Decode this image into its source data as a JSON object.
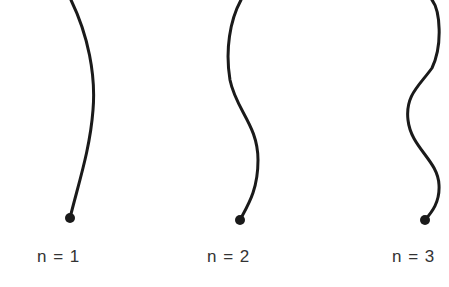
{
  "figure": {
    "colors": {
      "curve": "#1a1a1a",
      "label": "#333333",
      "background": "#ffffff"
    },
    "modes": [
      {
        "n": 1,
        "label": "n = 1",
        "label_x": 37,
        "path": "M 71 0 C 88 35, 96 75, 93 110 C 90 150, 78 185, 70 218",
        "dot": {
          "cx": 70,
          "cy": 218,
          "r": 5
        }
      },
      {
        "n": 2,
        "label": "n = 2",
        "label_x": 207,
        "path": "M 241 0 C 230 20, 225 50, 230 80 C 236 110, 258 125, 258 160 C 258 190, 248 205, 240 220",
        "dot": {
          "cx": 240,
          "cy": 220,
          "r": 5
        }
      },
      {
        "n": 3,
        "label": "n = 3",
        "label_x": 392,
        "path": "M 432 0 C 440 10, 443 45, 432 68 C 420 85, 405 95, 408 120 C 411 148, 438 160, 439 185 C 440 202, 432 212, 425 220",
        "dot": {
          "cx": 425,
          "cy": 220,
          "r": 5
        }
      }
    ]
  }
}
